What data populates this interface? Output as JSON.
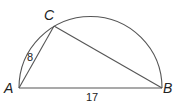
{
  "diagram": {
    "type": "geometry",
    "points": {
      "A": {
        "label": "A",
        "x": 19,
        "y": 88
      },
      "B": {
        "label": "B",
        "x": 162,
        "y": 88
      },
      "C": {
        "label": "C",
        "x": 54,
        "y": 26
      }
    },
    "segments": {
      "AC": {
        "label": "8"
      },
      "AB": {
        "label": "17"
      }
    },
    "colors": {
      "stroke": "#555555",
      "text": "#222222",
      "background": "#ffffff"
    }
  }
}
